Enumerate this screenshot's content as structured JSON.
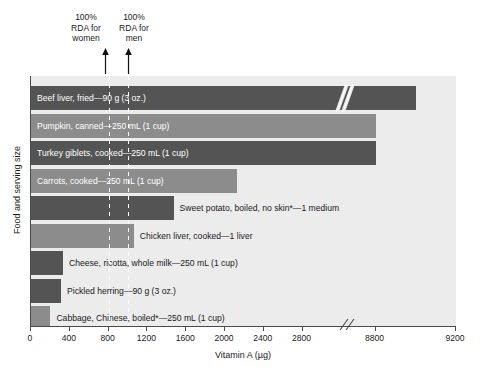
{
  "chart_data": {
    "type": "bar",
    "orientation": "horizontal",
    "title": "",
    "xlabel": "Vitamin A (µg)",
    "ylabel": "Food and serving size",
    "xticks": [
      0,
      400,
      800,
      1200,
      1600,
      2000,
      2400,
      2800,
      8800,
      9200
    ],
    "xtick_labels": [
      "0",
      "400",
      "800",
      "1200",
      "1600",
      "2000",
      "2400",
      "2800",
      "8800",
      "9200"
    ],
    "axis_break": true,
    "axis_break_between": [
      2800,
      8800
    ],
    "xlim": [
      0,
      9200
    ],
    "grid": false,
    "legend": "none",
    "categories": [
      "Beef liver, fried—90 g (3 oz.)",
      "Pumpkin, canned—250 mL (1 cup)",
      "Turkey giblets, cooked—250 mL (1 cup)",
      "Carrots, cooked—250 mL (1 cup)",
      "Sweet potato, boiled, no skin*—1 medium",
      "Chicken liver, cooked—1 liver",
      "Cheese, ricotta, whole milk—250 mL (1 cup)",
      "Pickled herring—90 g (3 oz.)",
      "Cabbage, Chinese, boiled*—250 mL (1 cup)"
    ],
    "values": [
      9000,
      2940,
      2920,
      2120,
      1470,
      1060,
      330,
      310,
      200
    ],
    "annotations": [
      {
        "text": "100%\nRDA for\nwomen",
        "value": 800
      },
      {
        "text": "100%\nRDA for\nmen",
        "value": 1000
      }
    ]
  },
  "bars": [
    {
      "label": "Beef liver, fried—90 g (3 oz.)",
      "value": 9000,
      "fill": "#545454",
      "label_position": "inside"
    },
    {
      "label": "Pumpkin, canned—250 mL (1 cup)",
      "value": 2940,
      "fill": "#8c8c8c",
      "label_position": "inside"
    },
    {
      "label": "Turkey giblets, cooked—250 mL (1 cup)",
      "value": 2920,
      "fill": "#545454",
      "label_position": "inside"
    },
    {
      "label": "Carrots, cooked—250 mL (1 cup)",
      "value": 2120,
      "fill": "#8c8c8c",
      "label_position": "inside"
    },
    {
      "label": "Sweet potato, boiled, no skin*—1 medium",
      "value": 1470,
      "fill": "#545454",
      "label_position": "outside"
    },
    {
      "label": "Chicken liver, cooked—1 liver",
      "value": 1060,
      "fill": "#8c8c8c",
      "label_position": "outside"
    },
    {
      "label": "Cheese, ricotta, whole milk—250 mL (1 cup)",
      "value": 330,
      "fill": "#545454",
      "label_position": "outside"
    },
    {
      "label": "Pickled herring—90 g (3 oz.)",
      "value": 310,
      "fill": "#545454",
      "label_position": "outside"
    },
    {
      "label": "Cabbage, Chinese, boiled*—250 mL (1 cup)",
      "value": 200,
      "fill": "#8c8c8c",
      "label_position": "outside"
    }
  ],
  "rda": {
    "women": {
      "text": "100%\nRDA for\nwomen",
      "value": 800
    },
    "men": {
      "text": "100%\nRDA for\nmen",
      "value": 1000
    }
  },
  "axes": {
    "x_title": "Vitamin A (µg)",
    "y_title": "Food and serving size",
    "ticks": [
      "0",
      "400",
      "800",
      "1200",
      "1600",
      "2000",
      "2400",
      "2800",
      "8800",
      "9200"
    ]
  },
  "colors": {
    "bar_dark": "#545454",
    "bar_light": "#8c8c8c",
    "plot_background": "#ececec",
    "axis": "#4a4a4a",
    "rda_line": "#ffffff"
  }
}
